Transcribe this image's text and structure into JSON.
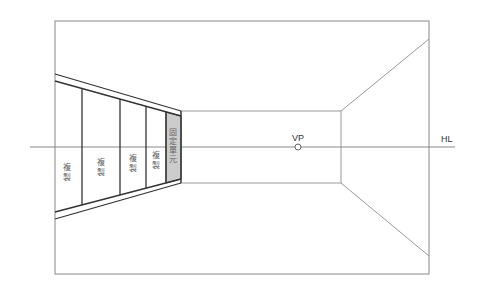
{
  "diagram": {
    "labels": {
      "vanishing_point": "VP",
      "horizon_line": "HL"
    },
    "panels": [
      {
        "label_line1": "複",
        "label_line2": "製"
      },
      {
        "label_line1": "複",
        "label_line2": "製"
      },
      {
        "label_line1": "複",
        "label_line2": "製"
      },
      {
        "label_line1": "複",
        "label_line2": "製"
      },
      {
        "label_line1": "固",
        "label_line2": "定",
        "label_line3": "單",
        "label_line4": "元"
      }
    ],
    "colors": {
      "frame": "#777777",
      "panel_lines": "#333333",
      "fixed_unit_fill": "#cccccc"
    }
  }
}
